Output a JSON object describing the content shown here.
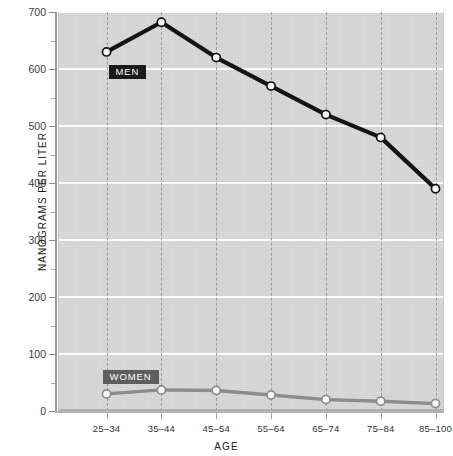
{
  "chart_data": {
    "type": "line",
    "title": "",
    "xlabel": "AGE",
    "ylabel": "NANOGRAMS PER LITER",
    "categories": [
      "25–34",
      "35–44",
      "45–54",
      "55–64",
      "65–74",
      "75–84",
      "85–100"
    ],
    "ylim": [
      0,
      700
    ],
    "yticks": [
      0,
      100,
      200,
      300,
      400,
      500,
      600,
      700
    ],
    "ytick_labels": [
      "0",
      "100",
      "200",
      "300",
      "400",
      "500",
      "600",
      "700"
    ],
    "yminor_ticks": [
      50,
      150,
      250,
      350,
      450,
      550,
      650
    ],
    "grid": {
      "horizontal": true,
      "vertical": true,
      "horizontal_style": "solid-white",
      "vertical_style": "dashed-gray"
    },
    "legend_position": "inline-labels",
    "series": [
      {
        "name": "MEN",
        "color": "#141414",
        "marker": "circle-white-fill",
        "values": [
          630,
          682,
          620,
          570,
          520,
          480,
          390
        ]
      },
      {
        "name": "WOMEN",
        "color": "#8c8c8c",
        "marker": "circle-white-fill",
        "values": [
          30,
          37,
          36,
          28,
          20,
          17,
          13
        ]
      }
    ],
    "annotations": [
      {
        "text": "MEN",
        "series": "MEN",
        "background": "#1a1a1a",
        "text_color": "#ffffff"
      },
      {
        "text": "WOMEN",
        "series": "WOMEN",
        "background": "#5e5e5e",
        "text_color": "#ffffff"
      }
    ],
    "colors": {
      "plot_background": "#d9d9d9",
      "page_background": "#ffffff",
      "horizontal_gridline": "#fdfdfd",
      "vertical_gridline": "#9d9d9d",
      "axis": "#9a9a9a",
      "men_line": "#141414",
      "women_line": "#8c8c8c"
    }
  }
}
